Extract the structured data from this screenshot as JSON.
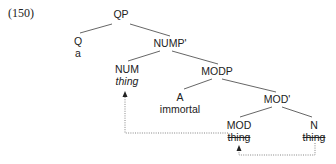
{
  "example_number": "(150)",
  "tree": {
    "nodes": {
      "qp": {
        "label": "QP"
      },
      "q": {
        "label": "Q",
        "word": "a"
      },
      "nump_bar": {
        "label": "NUMP'"
      },
      "num": {
        "label": "NUM",
        "word": "thing",
        "word_style": "italic"
      },
      "modp": {
        "label": "MODP"
      },
      "a": {
        "label": "A",
        "word": "immortal"
      },
      "mod_bar": {
        "label": "MOD'"
      },
      "mod": {
        "label": "MOD",
        "word": "thing",
        "word_style": "struck-through"
      },
      "n": {
        "label": "N",
        "word": "thing",
        "word_style": "struck-through"
      }
    },
    "edges": [
      [
        "QP",
        "Q"
      ],
      [
        "QP",
        "NUMP'"
      ],
      [
        "NUMP'",
        "NUM"
      ],
      [
        "NUMP'",
        "MODP"
      ],
      [
        "MODP",
        "A"
      ],
      [
        "MODP",
        "MOD'"
      ],
      [
        "MOD'",
        "MOD"
      ],
      [
        "MOD'",
        "N"
      ]
    ],
    "movements": [
      {
        "from": "N thing",
        "to": "MOD thing",
        "style": "dotted-arrow"
      },
      {
        "from": "MOD thing",
        "to": "NUM thing",
        "style": "dotted-arrow"
      }
    ]
  },
  "colors": {
    "line": "#555555",
    "text": "#222222",
    "dotted": "#777777"
  }
}
